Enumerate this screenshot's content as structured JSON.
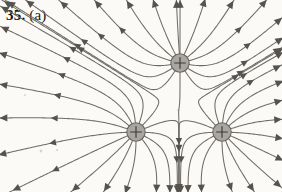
{
  "figure": {
    "label_number": "35.",
    "label_part": "(a)",
    "caption_full": "35. (a)",
    "kind": "electric-field-line-diagram",
    "background_color": "#fbfaf7",
    "line_color": "#6f6c68",
    "arrow_color": "#56534f",
    "charge_fill_color": "#a9a6a2",
    "charge_stroke_color": "#6a6763",
    "charge_sign_color": "#3c3a36"
  },
  "chart_data": {
    "type": "diagram",
    "subtitle": "",
    "xlabel": "",
    "ylabel": "",
    "grid": false,
    "legend": false,
    "axis_visible": false,
    "xlim": [
      0,
      282
    ],
    "ylim": [
      0,
      192
    ],
    "charges": [
      {
        "id": "charge-top",
        "label": "+",
        "sign": "positive",
        "x": 180,
        "y": 63,
        "radius": 9.2,
        "magnitude": 1
      },
      {
        "id": "charge-bottom-left",
        "label": "+",
        "sign": "positive",
        "x": 136,
        "y": 132,
        "radius": 9.2,
        "magnitude": 1
      },
      {
        "id": "charge-bottom-right",
        "label": "+",
        "sign": "positive",
        "x": 222,
        "y": 132,
        "radius": 9.2,
        "magnitude": 1
      }
    ],
    "neutral_point": {
      "x": 179,
      "y": 109
    },
    "field_line_count": 24,
    "arrow_direction": "outward"
  }
}
